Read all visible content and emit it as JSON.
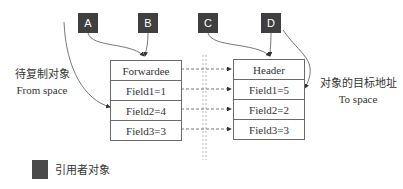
{
  "referrers": [
    {
      "id": "A"
    },
    {
      "id": "B"
    },
    {
      "id": "C"
    },
    {
      "id": "D"
    }
  ],
  "from_space": {
    "label_cn": "待复制对象",
    "label_en": "From space",
    "fields": [
      "Forwardee",
      "Field1=1",
      "Field2=4",
      "Field3=3"
    ]
  },
  "to_space": {
    "label_cn": "对象的目标地址",
    "label_en": "To space",
    "fields": [
      "Header",
      "Field1=5",
      "Field2=2",
      "Field3=3"
    ]
  },
  "legend": {
    "label": "引用者对象"
  },
  "colors": {
    "referrer_fill": "#3f3f3f",
    "border": "#6a6a6a",
    "text": "#333333"
  }
}
